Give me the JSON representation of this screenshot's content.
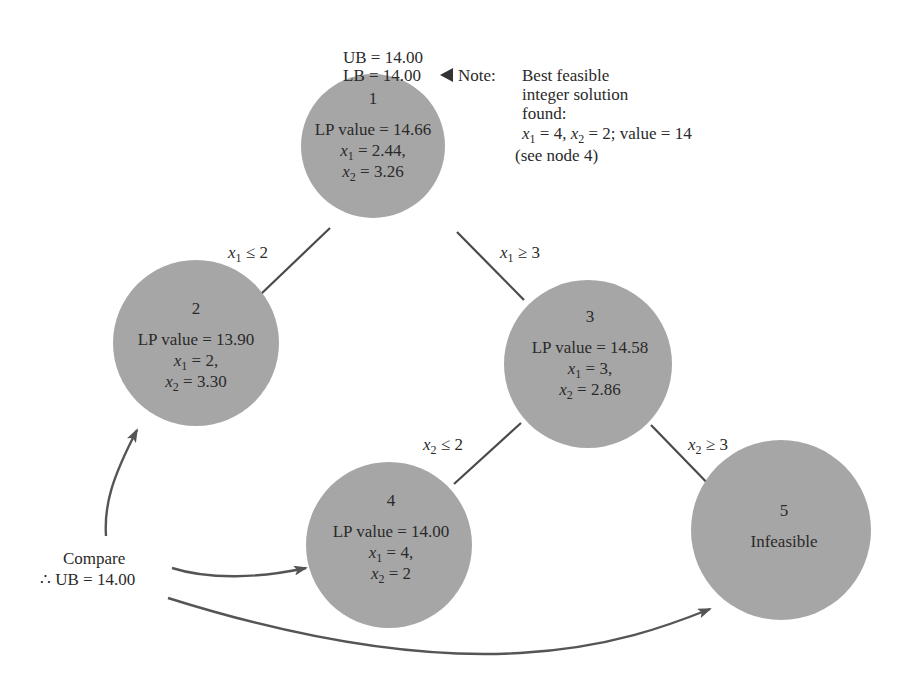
{
  "bounds": {
    "ub": "UB = 14.00",
    "lb": "LB = 14.00",
    "pointer_icon": "left-triangle"
  },
  "note": {
    "label": "Note:",
    "lines": [
      "Best feasible",
      "integer solution",
      "found:"
    ],
    "solution": {
      "x1_var": "x",
      "x1_sub": "1",
      "x1_val": " = 4, ",
      "x2_var": "x",
      "x2_sub": "2",
      "x2_val": " = 2; value = 14"
    },
    "ref": "(see node 4)"
  },
  "nodes": [
    {
      "id": "1",
      "lp": "LP value = 14.66",
      "x1": " = 2.44,",
      "x2": " = 3.26"
    },
    {
      "id": "2",
      "lp": "LP value = 13.90",
      "x1": " = 2,",
      "x2": " = 3.30"
    },
    {
      "id": "3",
      "lp": "LP value = 14.58",
      "x1": " = 3,",
      "x2": " = 2.86"
    },
    {
      "id": "4",
      "lp": "LP value = 14.00",
      "x1": " = 4,",
      "x2": " = 2"
    },
    {
      "id": "5",
      "status": "Infeasible"
    }
  ],
  "branches": [
    {
      "from": "1",
      "to": "2",
      "var": "x",
      "sub": "1",
      "rel": " ≤ 2"
    },
    {
      "from": "1",
      "to": "3",
      "var": "x",
      "sub": "1",
      "rel": " ≥ 3"
    },
    {
      "from": "3",
      "to": "4",
      "var": "x",
      "sub": "2",
      "rel": " ≤ 2"
    },
    {
      "from": "3",
      "to": "5",
      "var": "x",
      "sub": "2",
      "rel": " ≥ 3"
    }
  ],
  "compare": {
    "line1": "Compare",
    "line2": "∴ UB = 14.00"
  },
  "colors": {
    "node_fill": "#a6a6a6",
    "edge": "#4a4a4a",
    "text": "#2a2a2a",
    "background": "#ffffff"
  }
}
